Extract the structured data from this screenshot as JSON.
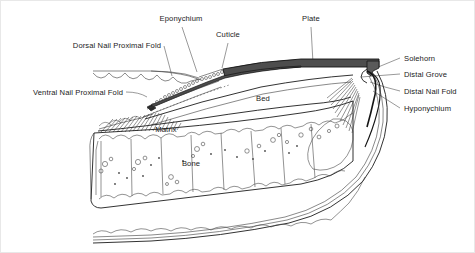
{
  "diagram": {
    "type": "anatomical-line-diagram",
    "background_color": "#ffffff",
    "ink_color": "#1c1c1c",
    "leader_color": "#6e6e6e",
    "plate_fill": "#4d4d4d",
    "solehorn_fill": "#5a5a5a",
    "wall_fill": "#777777",
    "labels": [
      {
        "id": "eponychium",
        "text": "Eponychium",
        "x": 180,
        "y": 20,
        "anchor": "middle"
      },
      {
        "id": "cuticle",
        "text": "Cuticle",
        "x": 227,
        "y": 36,
        "anchor": "middle"
      },
      {
        "id": "plate",
        "text": "Plate",
        "x": 310,
        "y": 20,
        "anchor": "middle"
      },
      {
        "id": "dorsal-nail-proximal-fold",
        "text": "Dorsal Nail Proximal Fold",
        "x": 160,
        "y": 47,
        "anchor": "end"
      },
      {
        "id": "ventral-nail-proximal-fold",
        "text": "Ventral Nail Proximal Fold",
        "x": 122,
        "y": 94,
        "anchor": "end"
      },
      {
        "id": "solehorn",
        "text": "Solehorn",
        "x": 403,
        "y": 60,
        "anchor": "start"
      },
      {
        "id": "distal-grove",
        "text": "Distal Grove",
        "x": 403,
        "y": 76,
        "anchor": "start"
      },
      {
        "id": "distal-nail-fold",
        "text": "Distal Nail Fold",
        "x": 403,
        "y": 93,
        "anchor": "start"
      },
      {
        "id": "hyponychium",
        "text": "Hyponychium",
        "x": 403,
        "y": 110,
        "anchor": "start"
      },
      {
        "id": "bed",
        "text": "Bed",
        "x": 262,
        "y": 100,
        "anchor": "middle"
      },
      {
        "id": "matrix",
        "text": "Matrix",
        "x": 165,
        "y": 131,
        "anchor": "middle"
      },
      {
        "id": "bone",
        "text": "Bone",
        "x": 190,
        "y": 165,
        "anchor": "middle"
      }
    ],
    "structures": [
      {
        "id": "nail-plate",
        "name": "Plate"
      },
      {
        "id": "nail-bed",
        "name": "Bed"
      },
      {
        "id": "distal-phalanx-bone",
        "name": "Bone"
      },
      {
        "id": "germinal-matrix",
        "name": "Matrix"
      },
      {
        "id": "dorsal-proximal-fold",
        "name": "Dorsal Nail Proximal Fold"
      },
      {
        "id": "ventral-proximal-fold",
        "name": "Ventral Nail Proximal Fold"
      },
      {
        "id": "eponychium-band",
        "name": "Eponychium"
      },
      {
        "id": "cuticle-band",
        "name": "Cuticle"
      },
      {
        "id": "solehorn-region",
        "name": "Solehorn"
      },
      {
        "id": "distal-grove-region",
        "name": "Distal Grove"
      },
      {
        "id": "distal-nail-fold-region",
        "name": "Distal Nail Fold"
      },
      {
        "id": "hyponychium-region",
        "name": "Hyponychium"
      },
      {
        "id": "sole-frog-line",
        "name": "Sole"
      }
    ]
  }
}
